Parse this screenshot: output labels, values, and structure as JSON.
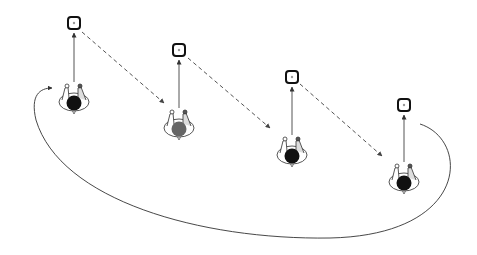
{
  "diagram": {
    "colors": {
      "background": "#ffffff",
      "line": "#333333",
      "dashed": "#555555",
      "head_dark": "#111111",
      "head_gray": "#666666",
      "body_outline": "#444444"
    },
    "stations": [
      {
        "id": "station-1",
        "head": "dark",
        "target_icon": "target-square-icon"
      },
      {
        "id": "station-2",
        "head": "gray",
        "target_icon": "target-square-icon"
      },
      {
        "id": "station-3",
        "head": "dark",
        "target_icon": "target-square-icon"
      },
      {
        "id": "station-4",
        "head": "dark",
        "target_icon": "target-square-icon"
      }
    ],
    "connectors": {
      "facing": "solid-arrow",
      "transition": "dashed-arrow",
      "return": "curved-solid-arrow"
    }
  }
}
